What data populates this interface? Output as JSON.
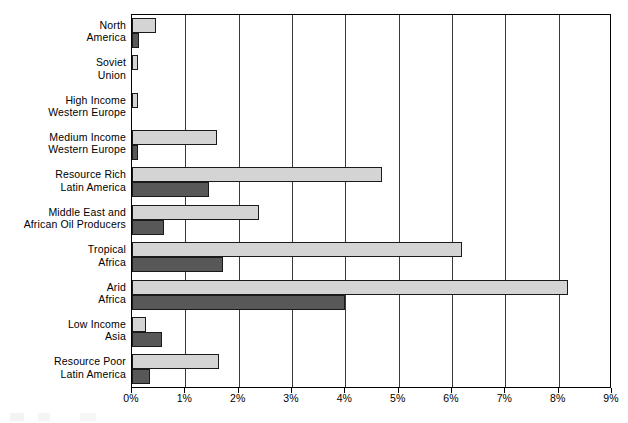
{
  "chart_data": {
    "type": "bar",
    "orientation": "horizontal",
    "title": "",
    "xlabel": "",
    "ylabel": "",
    "xlim": [
      0,
      9
    ],
    "xunit": "%",
    "grid": true,
    "legend_position": "none",
    "xticks": [
      "0%",
      "1%",
      "2%",
      "3%",
      "4%",
      "5%",
      "6%",
      "7%",
      "8%",
      "9%"
    ],
    "xtick_values": [
      0,
      1,
      2,
      3,
      4,
      5,
      6,
      7,
      8,
      9
    ],
    "categories": [
      "North America",
      "Soviet Union",
      "High Income Western Europe",
      "Medium Income Western Europe",
      "Resource Rich Latin America",
      "Middle East and African Oil Producers",
      "Tropical Africa",
      "Arid Africa",
      "Low Income Asia",
      "Resource Poor Latin America"
    ],
    "category_lines": [
      [
        "North",
        "America"
      ],
      [
        "Soviet",
        "Union"
      ],
      [
        "High Income",
        "Western Europe"
      ],
      [
        "Medium Income",
        "Western Europe"
      ],
      [
        "Resource Rich",
        "Latin America"
      ],
      [
        "Middle East and",
        "African Oil Producers"
      ],
      [
        "Tropical",
        "Africa"
      ],
      [
        "Arid",
        "Africa"
      ],
      [
        "Low Income",
        "Asia"
      ],
      [
        "Resource Poor",
        "Latin America"
      ]
    ],
    "series": [
      {
        "name": "light-series",
        "color": "#d4d4d4",
        "values": [
          0.45,
          0.11,
          0.12,
          1.6,
          4.68,
          2.39,
          6.18,
          8.18,
          0.26,
          1.63
        ]
      },
      {
        "name": "dark-series",
        "color": "#585858",
        "values": [
          0.13,
          0.0,
          0.0,
          0.11,
          1.45,
          0.6,
          1.71,
          3.99,
          0.56,
          0.34
        ]
      }
    ]
  },
  "colors": {
    "light_bar": "#d4d4d4",
    "dark_bar": "#585858",
    "axis": "#000000",
    "grid": "#3a3a3a",
    "background": "#ffffff"
  }
}
